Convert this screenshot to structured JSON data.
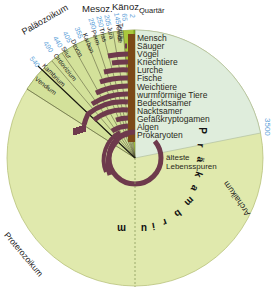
{
  "diagram": {
    "eras": {
      "palaeozoikum": "Paläozoikum",
      "mesozoikum": "Mesoz.",
      "kaenozoikum": "Känoz.",
      "quartaer": "Quartär",
      "proterozoikum": "Proterozoikum",
      "archaikum": "Archaikum",
      "praekambrium": [
        "P",
        "r",
        "ä",
        "k",
        "a",
        "m",
        "b",
        "r",
        "i",
        "u",
        "m"
      ]
    },
    "periods": [
      {
        "name": "Vendium",
        "start": "570"
      },
      {
        "name": "Kambrium",
        "start": "540"
      },
      {
        "name": "Ordovizium",
        "start": "490"
      },
      {
        "name": "Silur",
        "start": "440"
      },
      {
        "name": "Devon",
        "start": "405"
      },
      {
        "name": "Karbon",
        "start": "355"
      },
      {
        "name": "Perm",
        "start": "290"
      },
      {
        "name": "Trias",
        "start": "250"
      },
      {
        "name": "Jura",
        "start": "205"
      },
      {
        "name": "Kreide",
        "start": "145"
      },
      {
        "name": "Tertiär",
        "start": "65"
      },
      {
        "name": "Quartär",
        "start": "2"
      }
    ],
    "boundary_label": "3500",
    "organisms": [
      "Mensch",
      "Säuger",
      "Vögel",
      "Kriechtiere",
      "Lurche",
      "Fische",
      "Weichtiere",
      "wurmförmige Tiere",
      "Bedecktsamer",
      "Nacktsamer",
      "Gefäßkryptogamen",
      "Algen",
      "Prokaryoten"
    ],
    "oldest_traces": [
      "älteste",
      "Lebensspuren"
    ],
    "colors": {
      "precambrian": "#e0e9ad",
      "phanerozoic": "#d3e19a",
      "tertiary": "#a9c83c",
      "archaean_wedge": "#dfeddc",
      "bars": "#6e3a4c",
      "column": "#7b4a18",
      "numbers": "#5aa0d8",
      "lines": "#3a3a2a"
    }
  }
}
